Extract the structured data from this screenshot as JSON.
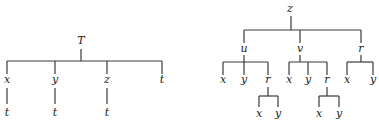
{
  "diagram": {
    "type": "tree-pair",
    "left_tree": {
      "root": "T",
      "children": [
        {
          "label": "x",
          "children": [
            {
              "label": "t"
            }
          ]
        },
        {
          "label": "y",
          "children": [
            {
              "label": "t"
            }
          ]
        },
        {
          "label": "z",
          "children": [
            {
              "label": "t"
            }
          ]
        },
        {
          "label": "t"
        }
      ]
    },
    "right_tree": {
      "root": "z",
      "children": [
        {
          "label": "u",
          "children": [
            {
              "label": "x"
            },
            {
              "label": "y"
            },
            {
              "label": "r",
              "children": [
                {
                  "label": "x"
                },
                {
                  "label": "y"
                }
              ]
            }
          ]
        },
        {
          "label": "v",
          "children": [
            {
              "label": "x"
            },
            {
              "label": "y"
            },
            {
              "label": "r",
              "children": [
                {
                  "label": "x"
                },
                {
                  "label": "y"
                }
              ]
            }
          ]
        },
        {
          "label": "r",
          "children": [
            {
              "label": "x"
            },
            {
              "label": "y"
            }
          ]
        }
      ]
    }
  },
  "labels": {
    "L_root": "T",
    "L_x": "x",
    "L_y": "y",
    "L_z": "z",
    "L_t": "t",
    "L_x_t": "t",
    "L_y_t": "t",
    "L_z_t": "t",
    "R_root": "z",
    "R_u": "u",
    "R_v": "v",
    "R_r": "r",
    "R_u_x": "x",
    "R_u_y": "y",
    "R_u_r": "r",
    "R_u_r_x": "x",
    "R_u_r_y": "y",
    "R_v_x": "x",
    "R_v_y": "y",
    "R_v_r": "r",
    "R_v_r_x": "x",
    "R_v_r_y": "y",
    "R_r_x": "x",
    "R_r_y": "y"
  },
  "colors": {
    "line": "#3a3a3a",
    "text": "#222222",
    "background": "#ffffff"
  }
}
